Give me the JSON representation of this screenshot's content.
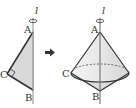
{
  "figure": {
    "axis_label": "l",
    "left": {
      "labels": {
        "A": "A",
        "B": "B",
        "C": "C"
      },
      "fill": "#d9d9d9",
      "stroke": "#333333"
    },
    "arrow": "➡",
    "right": {
      "labels": {
        "A": "A",
        "B": "B",
        "C": "C"
      },
      "fill": "#e9e9e9",
      "stroke": "#333333"
    }
  }
}
